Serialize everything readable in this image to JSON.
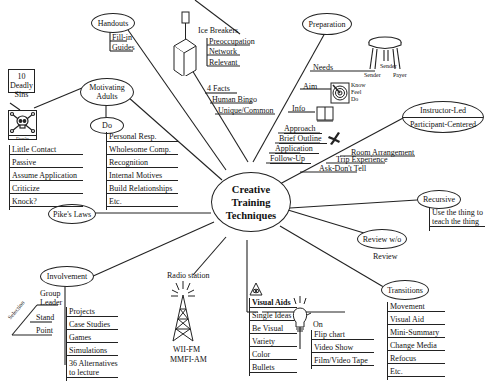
{
  "center": {
    "line1": "Creative",
    "line2": "Training",
    "line3": "Techniques"
  },
  "handouts": {
    "title": "Handouts",
    "items": [
      "Fill-in",
      "Guides"
    ]
  },
  "ice_breakers": {
    "title": "Ice Breakers",
    "items": [
      "Preoccupation",
      "Network",
      "Relevant"
    ]
  },
  "four_facts": {
    "title": "4 Facts",
    "items": [
      "Human Bingo",
      "Unique/Common"
    ]
  },
  "preparation": {
    "title": "Preparation",
    "needs": "Needs",
    "stool_labels": {
      "sender": "Sender",
      "sender2": "Sender",
      "payer": "Payer"
    },
    "aim": "Aim",
    "aim_items": [
      "Know",
      "Feel",
      "Do"
    ],
    "info": "Info",
    "steps": [
      "Approach",
      "Brief Outline",
      "Application",
      "Follow-Up"
    ]
  },
  "instructor": {
    "top": "Instructor-Led",
    "bottom": "Participant-Centered",
    "items": [
      "Room Arrangement",
      "Trip Experience",
      "Ask-Don't Tell"
    ]
  },
  "recursive": {
    "title": "Recursive",
    "line1": "Use the thing to",
    "line2": "teach the thing"
  },
  "review": {
    "title": "Review w/o",
    "sub": "Review"
  },
  "transitions": {
    "title": "Transitions",
    "items": [
      "Movement",
      "Visual Aid",
      "Mini-Summary",
      "Change Media",
      "Refocus",
      "Etc."
    ]
  },
  "visual_aids": {
    "title": "Visual Aids",
    "items": [
      "Single Ideas",
      "Be Visual",
      "Variety",
      "Color",
      "Bullets"
    ],
    "on": "On",
    "media": [
      "Flip chart",
      "Video Show",
      "Film/Video Tape"
    ]
  },
  "radio": {
    "title": "Radio station",
    "call1": "WII-FM",
    "call2": "MMFI-AM"
  },
  "involvement": {
    "title": "Involvement",
    "group": "Group",
    "leader": "Leader",
    "selection": "Selection",
    "stand": "Stand",
    "point": "Point",
    "items": [
      "Projects",
      "Case Studies",
      "Games",
      "Simulations",
      "36 Alternatives",
      "to lecture"
    ]
  },
  "pikes_laws": {
    "title": "Pike's Laws"
  },
  "motivating": {
    "line1": "Motivating",
    "line2": "Adults",
    "do": "Do",
    "do_items": [
      "Personal Resp.",
      "Wholesome Comp.",
      "Recognition",
      "Internal Motives",
      "Build Relationships",
      "Etc."
    ]
  },
  "deadly_sins": {
    "line1": "10 Deadly",
    "line2": "Sins",
    "donts": "Don'ts",
    "items": [
      "Little Contact",
      "Passive",
      "Assume Application",
      "Criticize",
      "Knock?"
    ]
  }
}
